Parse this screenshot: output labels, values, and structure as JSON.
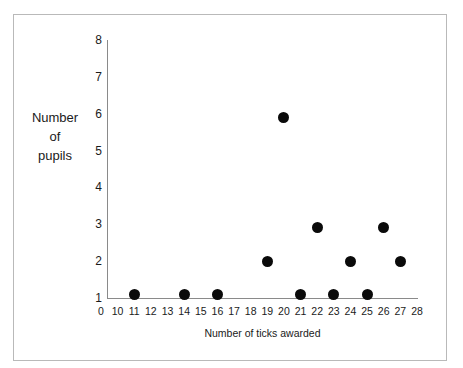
{
  "chart_data": {
    "type": "scatter",
    "title": "",
    "xlabel": "Number of ticks awarded",
    "ylabel_lines": [
      "Number",
      "of",
      "pupils"
    ],
    "ylabel": "Number of pupils",
    "x_ticks": [
      "0",
      "10",
      "11",
      "12",
      "13",
      "14",
      "15",
      "16",
      "17",
      "18",
      "19",
      "20",
      "21",
      "22",
      "23",
      "24",
      "25",
      "26",
      "27",
      "28"
    ],
    "y_ticks": [
      "1",
      "2",
      "3",
      "4",
      "5",
      "6",
      "7",
      "8"
    ],
    "xlim": [
      0,
      28
    ],
    "ylim": [
      1,
      8
    ],
    "grid": false,
    "legend": null,
    "marker": {
      "shape": "circle",
      "color": "#0a0a0a",
      "size_px": 11
    },
    "points": [
      {
        "x": 11,
        "y": 1.1
      },
      {
        "x": 14,
        "y": 1.1
      },
      {
        "x": 16,
        "y": 1.1
      },
      {
        "x": 19,
        "y": 2.0
      },
      {
        "x": 20,
        "y": 5.9
      },
      {
        "x": 21,
        "y": 1.1
      },
      {
        "x": 22,
        "y": 2.9
      },
      {
        "x": 23,
        "y": 1.1
      },
      {
        "x": 24,
        "y": 2.0
      },
      {
        "x": 25,
        "y": 1.1
      },
      {
        "x": 26,
        "y": 2.9
      },
      {
        "x": 27,
        "y": 2.0
      }
    ]
  },
  "colors": {
    "frame": "#b9b9b9",
    "axis": "#8a8a8a",
    "marker": "#0a0a0a",
    "text": "#1a1a1a",
    "background": "#ffffff"
  }
}
